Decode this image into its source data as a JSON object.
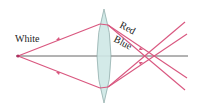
{
  "diagram": {
    "labels": {
      "source": "White",
      "red": "Red",
      "blue": "Blue"
    },
    "colors": {
      "ray": "#d9577f",
      "axis": "#555555",
      "lens_fill": "#cfe8e6",
      "lens_stroke": "#8aa8a6"
    }
  }
}
